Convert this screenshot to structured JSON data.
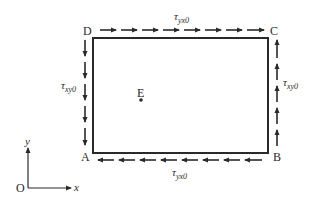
{
  "diagram": {
    "type": "shear-stress-element",
    "colors": {
      "stroke": "#2a2a2a",
      "background": "#ffffff"
    },
    "rectangle": {
      "x": 93,
      "y": 38,
      "width": 175,
      "height": 115
    },
    "corners": {
      "A": {
        "label": "A"
      },
      "B": {
        "label": "B"
      },
      "C": {
        "label": "C"
      },
      "D": {
        "label": "D"
      }
    },
    "center_point": {
      "label": "E"
    },
    "stress_labels": {
      "top": {
        "symbol": "τ",
        "subscript": "yx0"
      },
      "bottom": {
        "symbol": "τ",
        "subscript": "yx0"
      },
      "left": {
        "symbol": "τ",
        "subscript": "xy0"
      },
      "right": {
        "symbol": "τ",
        "subscript": "xy0"
      }
    },
    "arrows": {
      "top": {
        "direction": "right",
        "count": 8
      },
      "bottom": {
        "direction": "left",
        "count": 8
      },
      "left": {
        "direction": "down",
        "count": 5
      },
      "right": {
        "direction": "up",
        "count": 5
      }
    },
    "axes": {
      "origin_label": "O",
      "x_label": "x",
      "y_label": "y"
    }
  }
}
